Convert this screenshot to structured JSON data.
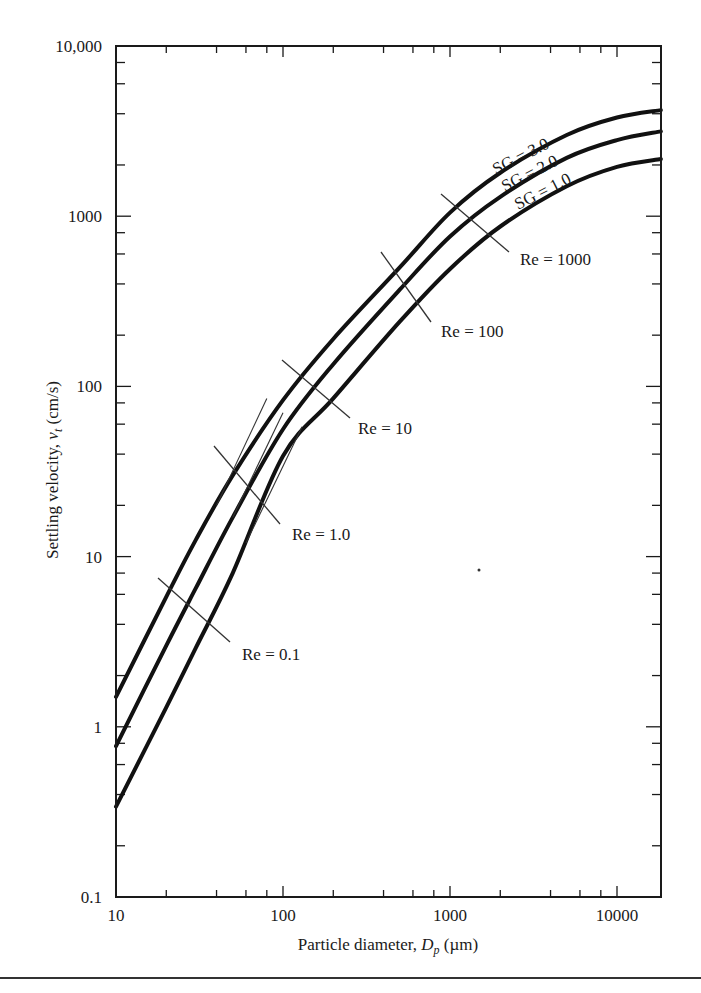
{
  "chart_data": {
    "type": "line",
    "title": "",
    "xlabel": "Particle diameter, D_p (µm)",
    "xlabel_parts": {
      "pre": "Particle diameter, ",
      "sym": "D",
      "sub": "p",
      "post": " (µm)"
    },
    "ylabel": "Settling velocity, v_t (cm/s)",
    "ylabel_parts": {
      "pre": "Settling velocity, ",
      "sym": "v",
      "sub": "t",
      "post": " (cm/s)"
    },
    "xscale": "log",
    "yscale": "log",
    "xlim": [
      10,
      18300
    ],
    "ylim": [
      0.1,
      10000
    ],
    "grid": false,
    "x_tick_labels": [
      {
        "value": 10,
        "label": "10"
      },
      {
        "value": 100,
        "label": "100"
      },
      {
        "value": 1000,
        "label": "1000"
      },
      {
        "value": 10000,
        "label": "10000"
      }
    ],
    "y_tick_labels": [
      {
        "value": 0.1,
        "label": "0.1"
      },
      {
        "value": 1,
        "label": "1"
      },
      {
        "value": 10,
        "label": "10"
      },
      {
        "value": 100,
        "label": "100"
      },
      {
        "value": 1000,
        "label": "1000"
      },
      {
        "value": 10000,
        "label": "10,000"
      }
    ],
    "minor_ticks": [
      2,
      4,
      6,
      8
    ],
    "series": [
      {
        "name": "SG = 3.0",
        "x": [
          10,
          20,
          30,
          50,
          100,
          200,
          500,
          1000,
          2000,
          5000,
          10000,
          18300
        ],
        "y": [
          1.5,
          5.8,
          12.5,
          30,
          83,
          190,
          500,
          1050,
          1800,
          3000,
          3800,
          4200
        ]
      },
      {
        "name": "SG = 2.0",
        "x": [
          10,
          20,
          30,
          50,
          100,
          200,
          500,
          1000,
          2000,
          5000,
          10000,
          18300
        ],
        "y": [
          0.77,
          3.0,
          6.5,
          17,
          56,
          135,
          370,
          760,
          1300,
          2200,
          2800,
          3150
        ]
      },
      {
        "name": "SG = 1.0",
        "x": [
          10,
          20,
          30,
          50,
          100,
          200,
          500,
          1000,
          2000,
          5000,
          10000,
          18300
        ],
        "y": [
          0.34,
          1.3,
          2.9,
          8,
          39,
          85,
          240,
          490,
          870,
          1500,
          1950,
          2170
        ]
      }
    ],
    "stokes_tangents": [
      {
        "series": "SG = 3.0",
        "from": [
          40,
          20
        ],
        "to": [
          80,
          85
        ]
      },
      {
        "series": "SG = 2.0",
        "from": [
          50,
          17
        ],
        "to": [
          100,
          70
        ]
      },
      {
        "series": "SG = 1.0",
        "from": [
          60,
          12
        ],
        "to": [
          130,
          58
        ]
      }
    ],
    "annotations": [
      {
        "label": "Re = 0.1",
        "line_px": [
          158,
          578,
          230,
          642
        ],
        "text_px": [
          242,
          660
        ]
      },
      {
        "label": "Re = 1.0",
        "line_px": [
          214,
          446,
          280,
          524
        ],
        "text_px": [
          292,
          540
        ]
      },
      {
        "label": "Re = 10",
        "line_px": [
          282,
          360,
          350,
          418
        ],
        "text_px": [
          358,
          434
        ]
      },
      {
        "label": "Re = 100",
        "line_px": [
          381,
          252,
          431,
          322
        ],
        "text_px": [
          441,
          337
        ]
      },
      {
        "label": "Re = 1000",
        "line_px": [
          441,
          194,
          509,
          252
        ],
        "text_px": [
          520,
          265
        ]
      }
    ],
    "series_labels": [
      {
        "label": "SG = 3.0",
        "text_px": [
          496,
          175
        ],
        "angle": -27
      },
      {
        "label": "SG = 2.0",
        "text_px": [
          505,
          192
        ],
        "angle": -27
      },
      {
        "label": "SG = 1.0",
        "text_px": [
          518,
          210
        ],
        "angle": -27
      }
    ],
    "legend": "none (curves labeled inline)"
  },
  "plot_box_px": {
    "left": 116,
    "top": 46,
    "right": 661,
    "bottom": 897
  },
  "colors": {
    "line": "#111111",
    "axis": "#1a1a1a",
    "background": "#ffffff"
  },
  "stray_dot_px": [
    479,
    570
  ]
}
